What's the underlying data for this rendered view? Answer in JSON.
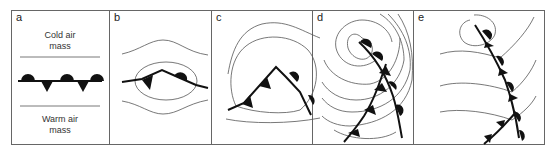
{
  "figure": {
    "panels": [
      {
        "id": "a",
        "label": "a",
        "top_text": [
          "Cold air",
          "mass"
        ],
        "bottom_text": [
          "Warm air",
          "mass"
        ],
        "description": "stationary front between cold and warm air masses"
      },
      {
        "id": "b",
        "label": "b",
        "description": "wave forms on front; isobars start to curve"
      },
      {
        "id": "c",
        "label": "c",
        "description": "cold and warm fronts around developing low"
      },
      {
        "id": "d",
        "label": "d",
        "description": "mature cyclone, cold front catching up with warm front"
      },
      {
        "id": "e",
        "label": "e",
        "description": "occluded front"
      }
    ],
    "colors": {
      "line": "#111111",
      "isobar": "#555555",
      "border": "#666666",
      "background": "#ffffff"
    }
  }
}
